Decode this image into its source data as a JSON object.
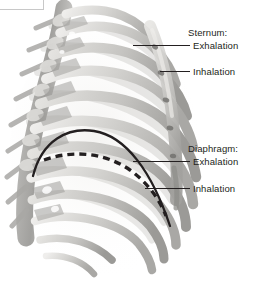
{
  "figure": {
    "background_color": "#ffffff",
    "ink_color": "#231f20",
    "bone_light": "#e9e8e6",
    "bone_mid": "#c9c8c5",
    "bone_dark": "#9d9c99"
  },
  "labels": {
    "sternum_title": "Sternum:",
    "sternum_exhalation": "Exhalation",
    "sternum_inhalation": "Inhalation",
    "diaphragm_title": "Diaphragm:",
    "diaphragm_exhalation": "Exhalation",
    "diaphragm_inhalation": "Inhalation"
  },
  "markers": {
    "diaphragm_exhalation_style": "solid",
    "diaphragm_inhalation_style": "dashed",
    "line_color": "#231f20"
  }
}
